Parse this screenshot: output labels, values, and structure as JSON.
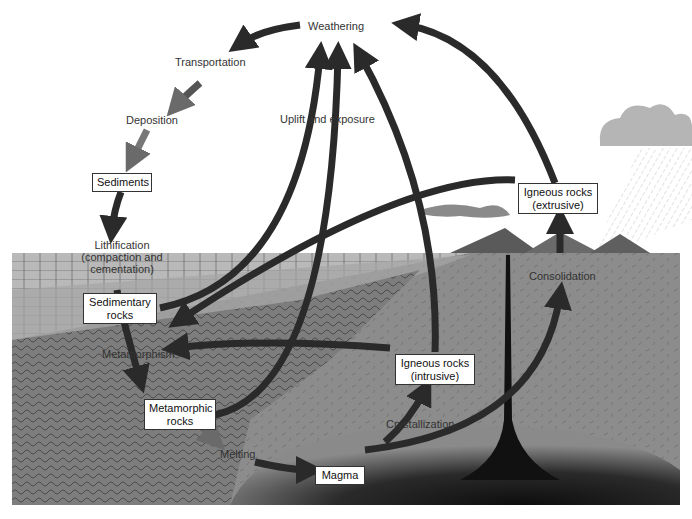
{
  "diagram": {
    "type": "rock-cycle",
    "processes": {
      "weathering": "Weathering",
      "transportation": "Transportation",
      "deposition": "Deposition",
      "lithification_1": "Lithification",
      "lithification_2": "(compaction and",
      "lithification_3": "cementation)",
      "uplift": "Uplift and exposure",
      "metamorphism": "Metamorphism",
      "melting": "Melting",
      "crystallization": "Crystallization",
      "consolidation": "Consolidation"
    },
    "rock_types": {
      "sediments": "Sediments",
      "sedimentary_1": "Sedimentary",
      "sedimentary_2": "rocks",
      "metamorphic_1": "Metamorphic",
      "metamorphic_2": "rocks",
      "magma": "Magma",
      "intrusive_1": "Igneous rocks",
      "intrusive_2": "(intrusive)",
      "extrusive_1": "Igneous rocks",
      "extrusive_2": "(extrusive)"
    },
    "colors": {
      "arrow": "#2a2a2a",
      "arrow_light": "#666666",
      "ground": "#8c8c8c",
      "magma": "#1a1a1a",
      "cloud": "#b5b5b5"
    }
  }
}
